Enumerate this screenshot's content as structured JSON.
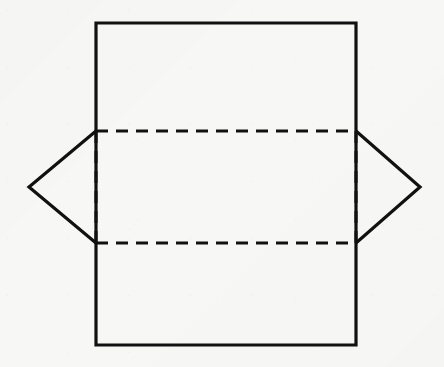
{
  "figure": {
    "background_color": "#f7f7f6",
    "stroke_color": "#111111",
    "solid_stroke_width": 3.2,
    "dashed_stroke_width": 3.0,
    "dash_pattern": "12 8",
    "canvas": {
      "width": 444,
      "height": 367
    },
    "points": {
      "rect_top_left": {
        "x": 96,
        "y": 23
      },
      "rect_top_right": {
        "x": 356,
        "y": 23
      },
      "rect_bottom_right": {
        "x": 356,
        "y": 345
      },
      "rect_bottom_left": {
        "x": 96,
        "y": 345
      },
      "fold_upper_left": {
        "x": 96,
        "y": 131
      },
      "fold_upper_right": {
        "x": 356,
        "y": 131
      },
      "fold_lower_right": {
        "x": 356,
        "y": 243
      },
      "fold_lower_left": {
        "x": 96,
        "y": 243
      },
      "left_apex": {
        "x": 29,
        "y": 187
      },
      "right_apex": {
        "x": 420,
        "y": 187
      }
    },
    "shapes": {
      "outer_rectangle": "96,23 356,23 356,345 96,345",
      "left_flap": "96,131 29,187 96,243",
      "right_flap": "356,131 420,187 356,243",
      "fold_line_top": "96,131 356,131",
      "fold_line_bottom": "96,243 356,243",
      "fold_line_left": "96,131 96,243",
      "fold_line_right": "356,131 356,243"
    }
  }
}
